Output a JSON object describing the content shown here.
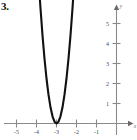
{
  "figure": {
    "problem_number": "3.",
    "background_color": "#ffffff",
    "curve_color": "#111111",
    "axis_color": "#8a8a8a",
    "tick_label_color": "#4a4a4a"
  },
  "chart_data": {
    "type": "line",
    "title": "",
    "subtitle": "",
    "xlabel": "x",
    "ylabel": "y",
    "xlim": [
      -5.8,
      -0.05
    ],
    "ylim": [
      -0.35,
      6.0
    ],
    "grid": false,
    "legend": null,
    "x_ticks": [
      -5,
      -4,
      -3,
      -2,
      -1
    ],
    "x_tick_labels": [
      "-5",
      "-4",
      "-3",
      "-2",
      "-1"
    ],
    "y_ticks": [
      1,
      2,
      3,
      4,
      5
    ],
    "y_tick_labels": [
      "1",
      "2",
      "3",
      "4",
      "5"
    ],
    "series": [
      {
        "name": "parabola",
        "equation": "y = 9(x + 3)^2",
        "vertex": [
          -3,
          0
        ],
        "x": [
          -3.85,
          -3.8,
          -3.7,
          -3.6,
          -3.5,
          -3.4,
          -3.3,
          -3.2,
          -3.1,
          -3.0,
          -2.9,
          -2.8,
          -2.7,
          -2.6,
          -2.5,
          -2.4,
          -2.3,
          -2.2,
          -2.15
        ],
        "y": [
          6.5,
          5.76,
          4.41,
          3.24,
          2.25,
          1.44,
          0.81,
          0.36,
          0.09,
          0.0,
          0.09,
          0.36,
          0.81,
          1.44,
          2.25,
          3.24,
          4.41,
          5.76,
          6.5
        ]
      }
    ],
    "annotations": []
  }
}
